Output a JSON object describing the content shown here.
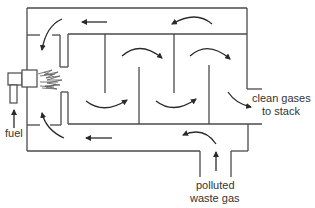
{
  "diagram": {
    "type": "process-flow",
    "labels": {
      "fuel": "fuel",
      "clean_line1": "clean gases",
      "clean_line2": "to stack",
      "polluted_line1": "polluted",
      "polluted_line2": "waste gas"
    },
    "components": [
      {
        "id": "burner",
        "name": "fuel burner with flame"
      },
      {
        "id": "fuel-inlet",
        "name": "fuel supply pipe"
      },
      {
        "id": "outer-casing",
        "name": "outer preheat duct"
      },
      {
        "id": "combustion-chamber",
        "name": "inner baffled chamber"
      },
      {
        "id": "baffles",
        "name": "alternating baffles",
        "count": 4
      },
      {
        "id": "waste-gas-inlet",
        "name": "polluted waste gas inlet duct"
      },
      {
        "id": "stack-outlet",
        "name": "clean gas outlet to stack"
      }
    ],
    "flow": [
      "polluted waste gas enters from bottom inlet",
      "flows left along lower outer duct",
      "turns up along left side",
      "flows right along upper outer duct? (arrows show leftward on top)",
      "enters chamber past burner flame",
      "weaves over and under baffles",
      "exits right as clean gases to stack"
    ],
    "colors": {
      "line": "#4a4a4a",
      "arrow": "#2a2a2a",
      "text": "#333333",
      "background": "#ffffff"
    }
  }
}
